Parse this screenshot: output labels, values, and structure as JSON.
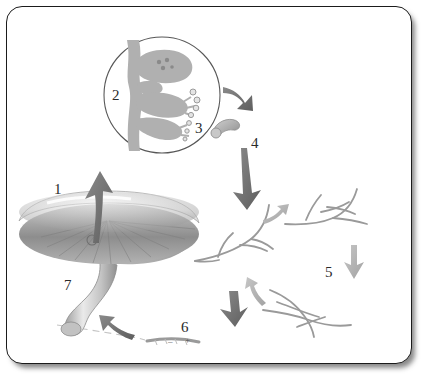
{
  "figure": {
    "background_color": "#ffffff",
    "border_color": "#1b1b1b",
    "arrow_color_dark": "#6e6e6e",
    "arrow_color_light": "#b4b4b4",
    "hypha_color": "#8f8f8f",
    "basidium_fill": "#b0b0b0",
    "label_color": "#2a2a2a"
  },
  "labels": [
    {
      "id": "1",
      "text": "1",
      "x": 47,
      "y": 175,
      "meaning": "spore-release-arrow"
    },
    {
      "id": "2",
      "text": "2",
      "x": 105,
      "y": 81,
      "meaning": "basidium"
    },
    {
      "id": "3",
      "text": "3",
      "x": 188,
      "y": 114,
      "meaning": "basidiospores"
    },
    {
      "id": "4",
      "text": "4",
      "x": 244,
      "y": 129,
      "meaning": "germinating-spore"
    },
    {
      "id": "5",
      "text": "5",
      "x": 318,
      "y": 258,
      "meaning": "hyphae"
    },
    {
      "id": "6",
      "text": "6",
      "x": 174,
      "y": 313,
      "meaning": "plasmogamy-mating-types"
    },
    {
      "id": "7",
      "text": "7",
      "x": 57,
      "y": 271,
      "meaning": "fruiting-body-mushroom"
    }
  ],
  "mating_signs": [
    {
      "text": "–",
      "x": 161,
      "y": 330,
      "meaning": "minus-mating-type"
    },
    {
      "text": "+",
      "x": 178,
      "y": 329,
      "meaning": "plus-mating-type"
    }
  ],
  "elements": {
    "magnifier_circle": {
      "cx": 155,
      "cy": 88,
      "r": 58,
      "meaning": "gill-cross-section-magnified-inset"
    },
    "mushroom": {
      "meaning": "mushroom-fruiting-body-with-cap-gills-and-stalk"
    },
    "germinating_spore": {
      "meaning": "single-germinating-basidiospore"
    },
    "hyphae_clusters": [
      {
        "meaning": "hypha-cluster-lower-left"
      },
      {
        "meaning": "hypha-cluster-upper-right"
      },
      {
        "meaning": "hypha-cluster-bottom-right-fusing"
      }
    ]
  },
  "arrows": [
    {
      "name": "arrow-mushroom-to-inset",
      "tone": "dark"
    },
    {
      "name": "arrow-inset-to-spore",
      "tone": "dark"
    },
    {
      "name": "arrow-spore-to-hyphae",
      "tone": "dark"
    },
    {
      "name": "arrow-hyphae-small-right",
      "tone": "light"
    },
    {
      "name": "arrow-hyphae-down-right",
      "tone": "light"
    },
    {
      "name": "arrow-hyphae-to-fusion",
      "tone": "light"
    },
    {
      "name": "arrow-fusion-left",
      "tone": "dark"
    },
    {
      "name": "arrow-fusion-to-mushroom",
      "tone": "dark"
    }
  ]
}
